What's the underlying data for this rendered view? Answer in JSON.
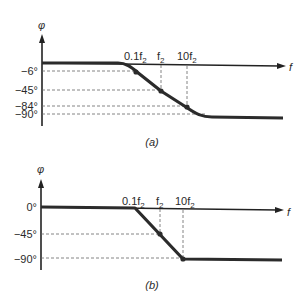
{
  "figure": {
    "panels": [
      {
        "id": "a",
        "caption": "(a)",
        "y_axis_label": "φ",
        "x_axis_label": "f",
        "curve_type": "smooth",
        "y_ticks": [
          "−6°",
          "−45°",
          "−84°",
          "−90°"
        ],
        "x_marks": [
          {
            "base": "0.1f",
            "sub": "2"
          },
          {
            "base": "f",
            "sub": "2"
          },
          {
            "base": "10f",
            "sub": "2"
          }
        ],
        "points": [
          {
            "freq": "0.1f2",
            "phase_deg": -6
          },
          {
            "freq": "f2",
            "phase_deg": -45
          },
          {
            "freq": "10f2",
            "phase_deg": -84
          }
        ],
        "asymptote_deg": -90
      },
      {
        "id": "b",
        "caption": "(b)",
        "y_axis_label": "φ",
        "x_axis_label": "f",
        "curve_type": "piecewise-linear approximation",
        "y_ticks": [
          "0°",
          "−45°",
          "−90°"
        ],
        "x_marks": [
          {
            "base": "0.1f",
            "sub": "2"
          },
          {
            "base": "f",
            "sub": "2"
          },
          {
            "base": "10f",
            "sub": "2"
          }
        ],
        "points": [
          {
            "freq": "f2",
            "phase_deg": -45
          },
          {
            "freq": "10f2",
            "phase_deg": -90
          }
        ],
        "asymptote_deg": -90
      }
    ]
  }
}
